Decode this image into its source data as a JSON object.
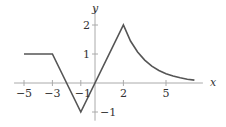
{
  "chart_data": {
    "type": "line",
    "title": "",
    "xlabel": "x",
    "ylabel": "y",
    "xlim": [
      -5.7,
      7.6
    ],
    "ylim": [
      -1.3,
      2.6
    ],
    "grid": false,
    "x_ticks": [
      -5,
      -3,
      -1,
      2,
      5
    ],
    "x_tick_labels": [
      "−5",
      "−3",
      "−1",
      "2",
      "5"
    ],
    "y_ticks": [
      2,
      1,
      -1
    ],
    "y_tick_labels": [
      "2",
      "1",
      "−1"
    ],
    "series": [
      {
        "name": "f(x)",
        "points": [
          [
            -5,
            1
          ],
          [
            -3,
            1
          ],
          [
            -1,
            -1
          ],
          [
            2,
            2
          ],
          [
            2.5,
            1.45
          ],
          [
            3,
            1.07
          ],
          [
            3.5,
            0.79
          ],
          [
            4,
            0.58
          ],
          [
            4.5,
            0.43
          ],
          [
            5,
            0.32
          ],
          [
            5.5,
            0.24
          ],
          [
            6,
            0.18
          ],
          [
            6.5,
            0.13
          ],
          [
            7,
            0.1
          ]
        ],
        "color": "#555555"
      }
    ],
    "px": {
      "x0": 95,
      "y0": 83,
      "sx": 14.2,
      "sy": 29
    }
  }
}
